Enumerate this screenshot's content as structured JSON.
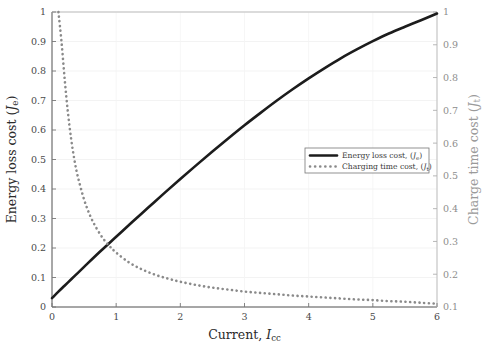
{
  "figure": {
    "background": "#ffffff",
    "plot_area": {
      "left": 52,
      "top": 12,
      "right": 437,
      "bottom": 307
    }
  },
  "axes": {
    "x": {
      "label_main": "Current, ",
      "label_var": "I",
      "label_sub": "cc",
      "ticks": [
        "0",
        "1",
        "2",
        "3",
        "4",
        "5",
        "6"
      ],
      "min": 0,
      "max": 6,
      "color": "#2b2b2b"
    },
    "y_left": {
      "label_main": "Energy loss cost ",
      "label_paren_open": "(",
      "label_var": "J",
      "label_sub": "e",
      "label_paren_close": ")",
      "ticks": [
        "0",
        "0.1",
        "0.2",
        "0.3",
        "0.4",
        "0.5",
        "0.6",
        "0.7",
        "0.8",
        "0.9",
        "1"
      ],
      "min": 0,
      "max": 1,
      "color": "#2b2b2b"
    },
    "y_right": {
      "label_main": "Charge time cost ",
      "label_paren_open": "(",
      "label_var": "J",
      "label_sub": "t",
      "label_paren_close": ")",
      "ticks": [
        "0.1",
        "0.2",
        "0.3",
        "0.4",
        "0.5",
        "0.6",
        "0.7",
        "0.8",
        "0.9",
        "1"
      ],
      "min": 0.1,
      "max": 1,
      "color": "#9a9a9a"
    }
  },
  "legend": {
    "entries": [
      {
        "style": "solid",
        "color": "#1c1c1c",
        "text_main": "Energy loss cost, ",
        "paren_open": "(",
        "var": "J",
        "sub": "e",
        "paren_close": ")"
      },
      {
        "style": "dotted",
        "color": "#8a8a8a",
        "text_main": "Charging time cost, ",
        "paren_open": "(",
        "var": "J",
        "sub": "t",
        "paren_close": ")"
      }
    ],
    "box": {
      "x": 305,
      "y": 148,
      "w": 124,
      "h": 25
    }
  },
  "chart_data": {
    "type": "line",
    "title": "",
    "xlabel": "Current, I_cc",
    "ylabel": "Energy loss cost (J_e)",
    "ylabel_right": "Charge time cost (J_t)",
    "xlim": [
      0,
      6
    ],
    "ylim": [
      0,
      1
    ],
    "ylim_right": [
      0.1,
      1
    ],
    "grid": true,
    "legend_position": "lower-right-inside",
    "series": [
      {
        "name": "Energy loss cost, (J_e)",
        "axis": "left",
        "style": "solid",
        "color": "#1c1c1c",
        "linewidth": 2.6,
        "x": [
          0,
          0.1,
          0.2,
          0.3,
          0.4,
          0.5,
          0.75,
          1.0,
          1.25,
          1.5,
          1.75,
          2.0,
          2.25,
          2.5,
          2.75,
          3.0,
          3.25,
          3.5,
          3.75,
          4.0,
          4.25,
          4.5,
          4.75,
          5.0,
          5.25,
          5.5,
          5.75,
          6.0
        ],
        "y": [
          0.03,
          0.052,
          0.073,
          0.094,
          0.115,
          0.136,
          0.188,
          0.238,
          0.288,
          0.337,
          0.386,
          0.434,
          0.481,
          0.527,
          0.572,
          0.616,
          0.658,
          0.699,
          0.738,
          0.775,
          0.81,
          0.843,
          0.873,
          0.901,
          0.927,
          0.95,
          0.972,
          0.995
        ]
      },
      {
        "name": "Charging time cost, (J_t)",
        "axis": "right",
        "style": "dotted",
        "color": "#8a8a8a",
        "linewidth": 2.6,
        "x": [
          0.1,
          0.15,
          0.2,
          0.25,
          0.3,
          0.35,
          0.4,
          0.5,
          0.6,
          0.7,
          0.8,
          0.9,
          1.0,
          1.2,
          1.4,
          1.6,
          1.8,
          2.0,
          2.25,
          2.5,
          2.75,
          3.0,
          3.25,
          3.5,
          3.75,
          4.0,
          4.25,
          4.5,
          4.75,
          5.0,
          5.25,
          5.5,
          5.75,
          6.0
        ],
        "y": [
          1.0,
          0.905,
          0.79,
          0.69,
          0.61,
          0.548,
          0.5,
          0.428,
          0.376,
          0.338,
          0.308,
          0.285,
          0.266,
          0.236,
          0.215,
          0.199,
          0.187,
          0.177,
          0.167,
          0.159,
          0.153,
          0.147,
          0.143,
          0.139,
          0.135,
          0.132,
          0.129,
          0.126,
          0.123,
          0.121,
          0.118,
          0.116,
          0.113,
          0.11
        ]
      }
    ]
  }
}
